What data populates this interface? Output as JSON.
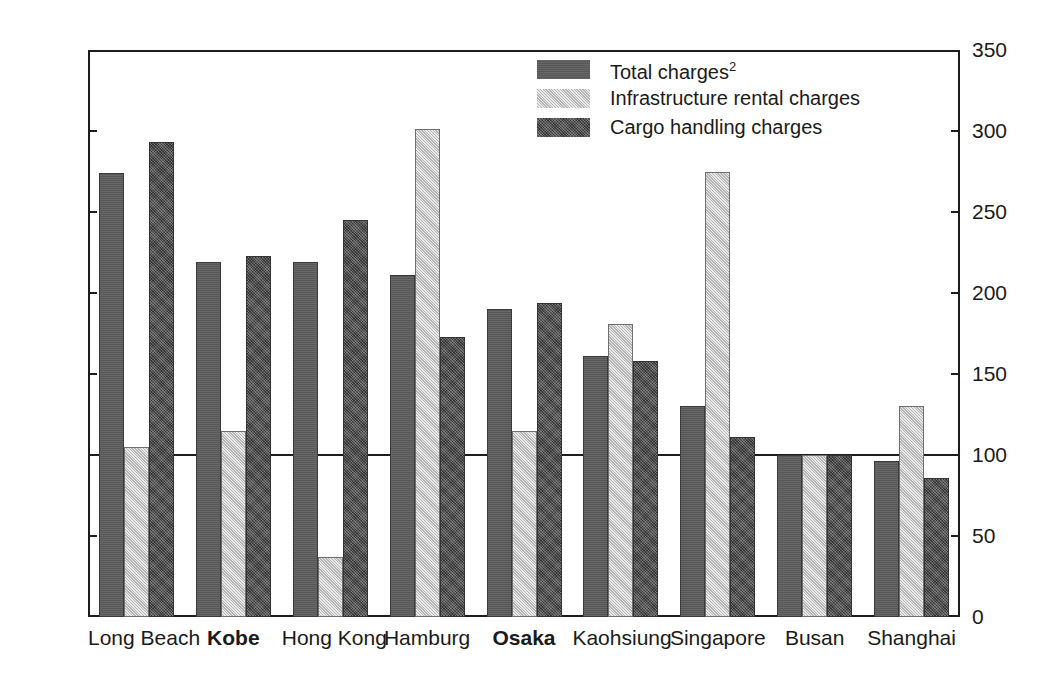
{
  "chart_data": {
    "type": "bar",
    "title": "",
    "subtitle": "",
    "xlabel": "",
    "ylabel": "",
    "ylim": [
      0,
      350
    ],
    "yticks": [
      0,
      50,
      100,
      150,
      200,
      250,
      300,
      350
    ],
    "ytick_labels": [
      "0",
      "50",
      "100",
      "150",
      "200",
      "250",
      "300",
      "350"
    ],
    "right_axis": true,
    "right_ytick_labels": [
      "0",
      "50",
      "100",
      "150",
      "200",
      "250",
      "300",
      "350"
    ],
    "grid": false,
    "reference_line": 100,
    "legend_position": "top-center",
    "categories": [
      "Long Beach",
      "Kobe",
      "Hong Kong",
      "Hamburg",
      "Osaka",
      "Kaohsiung",
      "Singapore",
      "Busan",
      "Shanghai"
    ],
    "categories_bold": [
      "Kobe",
      "Osaka"
    ],
    "series": [
      {
        "name": "Total charges²",
        "key": "total",
        "fill": "dark-gray-solid",
        "color": "#5d5d5d",
        "values": [
          274,
          219,
          219,
          211,
          190,
          161,
          130,
          100,
          96
        ]
      },
      {
        "name": "Infrastructure rental charges",
        "key": "infrastructure",
        "fill": "light-gray-hatch",
        "color": "#cfcfcf",
        "values": [
          105,
          115,
          37,
          301,
          115,
          181,
          275,
          100,
          130
        ]
      },
      {
        "name": "Cargo handling charges",
        "key": "cargo",
        "fill": "dark-gray-texture",
        "color": "#4e4e4e",
        "values": [
          293,
          223,
          245,
          173,
          194,
          158,
          111,
          100,
          86
        ]
      }
    ]
  },
  "legend": {
    "items": [
      {
        "label_main": "Total charges",
        "label_sup": "2",
        "swatch": "total-swatch"
      },
      {
        "label_main": "Infrastructure rental charges",
        "label_sup": "",
        "swatch": "infrastructure-swatch"
      },
      {
        "label_main": "Cargo handling charges",
        "label_sup": "",
        "swatch": "cargo-swatch"
      }
    ]
  }
}
